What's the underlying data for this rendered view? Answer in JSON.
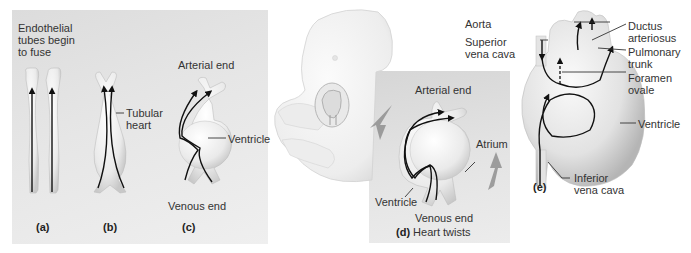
{
  "figure": {
    "panels": [
      {
        "id": "a",
        "caption": "(a)",
        "labels": [
          "Endothelial tubes begin to fuse"
        ]
      },
      {
        "id": "b",
        "caption": "(b)",
        "labels": [
          "Tubular heart"
        ]
      },
      {
        "id": "c",
        "caption": "(c)",
        "labels": [
          "Arterial end",
          "Ventricle",
          "Venous end"
        ]
      },
      {
        "id": "d",
        "caption": "(d)",
        "caption_text": "Heart twists",
        "labels": [
          "Arterial end",
          "Atrium",
          "Ventricle",
          "Venous end"
        ]
      },
      {
        "id": "e",
        "caption": "(e)",
        "labels": [
          "Aorta",
          "Superior vena cava",
          "Ductus arteriosus",
          "Pulmonary trunk",
          "Foramen ovale",
          "Ventricle",
          "Inferior vena cava"
        ]
      }
    ],
    "text": {
      "a_line1": "Endothelial",
      "a_line2": "tubes begin",
      "a_line3": "to fuse",
      "b_tubular_1": "Tubular",
      "b_tubular_2": "heart",
      "c_arterial": "Arterial end",
      "c_ventricle": "Ventricle",
      "c_venous": "Venous end",
      "d_arterial": "Arterial end",
      "d_atrium": "Atrium",
      "d_ventricle": "Ventricle",
      "d_venous": "Venous end",
      "d_twists": "Heart twists",
      "e_aorta": "Aorta",
      "e_svc_1": "Superior",
      "e_svc_2": "vena cava",
      "e_ductus_1": "Ductus",
      "e_ductus_2": "arteriosus",
      "e_pulm_1": "Pulmonary",
      "e_pulm_2": "trunk",
      "e_foramen_1": "Foramen",
      "e_foramen_2": "ovale",
      "e_ventricle": "Ventricle",
      "e_ivc_1": "Inferior",
      "e_ivc_2": "vena cava"
    },
    "captions": {
      "a": "(a)",
      "b": "(b)",
      "c": "(c)",
      "d": "(d)",
      "e": "(e)"
    },
    "colors": {
      "panel_bg": "#e4e4e4",
      "tissue": "#f2f2f2",
      "tissue_shade": "#cfcfcf",
      "arrow": "#111111",
      "twist_arrow": "#8a8a8a",
      "text": "#333333"
    }
  }
}
